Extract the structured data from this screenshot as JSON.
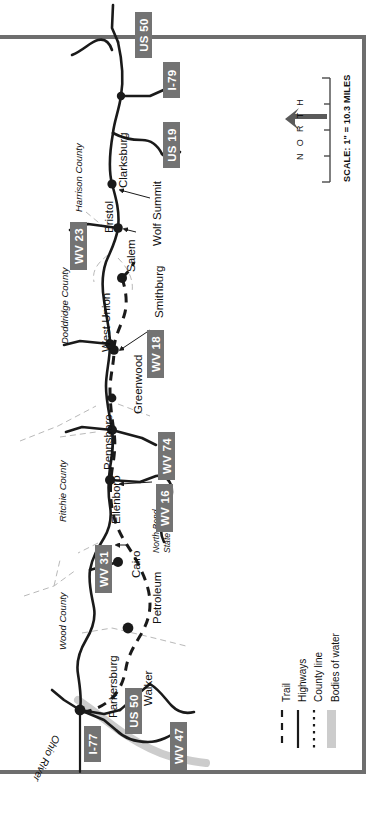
{
  "map": {
    "title": "North Bend Rail Trail Corridor Map",
    "orientation_note": "map rotated 90 degrees; labels read bottom-to-top",
    "north_label": "N O R T H",
    "scale_label": "SCALE: 1\" = 10.3 MILES",
    "scale_ticks": 5,
    "colors": {
      "shield_fill": "#737373",
      "shield_text": "#ffffff",
      "frame": "#6e6e6e",
      "highway": "#1a1a1a",
      "trail": "#1a1a1a",
      "county_line": "#bbbbbb",
      "water": "#cccccc",
      "text": "#111111"
    }
  },
  "shields": [
    {
      "label": "US 50",
      "x": 118,
      "y": 12,
      "w": 46,
      "h": 17
    },
    {
      "label": "I-79",
      "x": 146,
      "y": 62,
      "w": 36,
      "h": 17
    },
    {
      "label": "US 19",
      "x": 146,
      "y": 122,
      "w": 46,
      "h": 17
    },
    {
      "label": "WV 23",
      "x": 75,
      "y": 218,
      "w": 48,
      "h": 17
    },
    {
      "label": "WV 18",
      "x": 132,
      "y": 325,
      "w": 48,
      "h": 17
    },
    {
      "label": "WV 74",
      "x": 143,
      "y": 425,
      "w": 48,
      "h": 17
    },
    {
      "label": "WV 16",
      "x": 141,
      "y": 477,
      "w": 48,
      "h": 17
    },
    {
      "label": "WV 31",
      "x": 98,
      "y": 540,
      "w": 48,
      "h": 17
    },
    {
      "label": "US 50",
      "x": 124,
      "y": 683,
      "w": 46,
      "h": 17
    },
    {
      "label": "WV 47",
      "x": 167,
      "y": 718,
      "w": 48,
      "h": 17
    },
    {
      "label": "I-77",
      "x": 85,
      "y": 722,
      "w": 36,
      "h": 17
    }
  ],
  "places": [
    {
      "name": "Clarksburg",
      "x": 118,
      "y": 188
    },
    {
      "name": "Bristol",
      "x": 104,
      "y": 233
    },
    {
      "name": "Wolf Summit",
      "x": 152,
      "y": 246
    },
    {
      "name": "Salem",
      "x": 124,
      "y": 272
    },
    {
      "name": "Smithburg",
      "x": 152,
      "y": 318
    },
    {
      "name": "West Union",
      "x": 103,
      "y": 350
    },
    {
      "name": "Greenwood",
      "x": 135,
      "y": 412
    },
    {
      "name": "Pennsboro",
      "x": 105,
      "y": 470
    },
    {
      "name": "Ellenboro",
      "x": 110,
      "y": 523
    },
    {
      "name": "Cairo",
      "x": 130,
      "y": 578
    },
    {
      "name": "Petroleum",
      "x": 152,
      "y": 623
    },
    {
      "name": "Walker",
      "x": 142,
      "y": 706
    },
    {
      "name": "Parkersburg",
      "x": 110,
      "y": 716
    }
  ],
  "parks": [
    {
      "name": "North Bend",
      "x": 152,
      "y": 553
    },
    {
      "name": "State Park",
      "x": 162,
      "y": 553
    }
  ],
  "counties": [
    {
      "name": "Harrison County",
      "x": 75,
      "y": 210
    },
    {
      "name": "Doddridge County",
      "x": 62,
      "y": 342
    },
    {
      "name": "Ritchie County",
      "x": 60,
      "y": 520
    },
    {
      "name": "Wood County",
      "x": 60,
      "y": 650
    }
  ],
  "water": [
    {
      "name": "Ohio River",
      "x": 64,
      "y": 742
    }
  ],
  "legend": {
    "items": [
      {
        "label": "Trail",
        "style": "dashed"
      },
      {
        "label": "Highways",
        "style": "solid"
      },
      {
        "label": "County line",
        "style": "dotted"
      },
      {
        "label": "Bodies of water",
        "style": "band"
      }
    ]
  }
}
